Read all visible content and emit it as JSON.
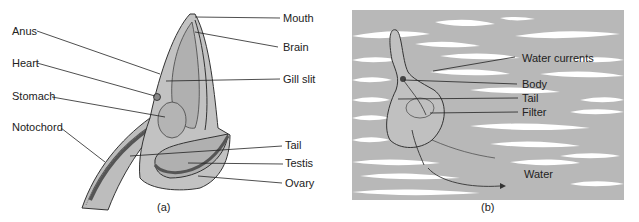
{
  "figure": {
    "panel_a": {
      "caption": "(a)",
      "labels": {
        "anus": "Anus",
        "heart": "Heart",
        "stomach": "Stomach",
        "notochord": "Notochord",
        "mouth": "Mouth",
        "brain": "Brain",
        "gill_slit": "Gill slit",
        "tail": "Tail",
        "testis": "Testis",
        "ovary": "Ovary"
      }
    },
    "panel_b": {
      "caption": "(b)",
      "labels": {
        "water_currents": "Water currents",
        "body": "Body",
        "tail": "Tail",
        "filter": "Filter",
        "water": "Water"
      }
    },
    "colors": {
      "body_fill": "#bdbdbd",
      "background_grey": "#b8b8b8",
      "line": "#222222",
      "organ_dark": "#6e6e6e"
    }
  }
}
